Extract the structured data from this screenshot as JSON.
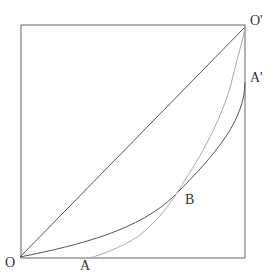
{
  "diagram": {
    "type": "edgeworth-box-contract-curves",
    "labels": {
      "origin": "O",
      "opposite_origin": "O'",
      "point_a": "A",
      "point_a_prime": "A'",
      "point_b": "B"
    },
    "colors": {
      "box": "#666666",
      "diagonal": "#555555",
      "dark_curve": "#555555",
      "light_curve": "#aaaaaa",
      "label": "#333333"
    }
  }
}
